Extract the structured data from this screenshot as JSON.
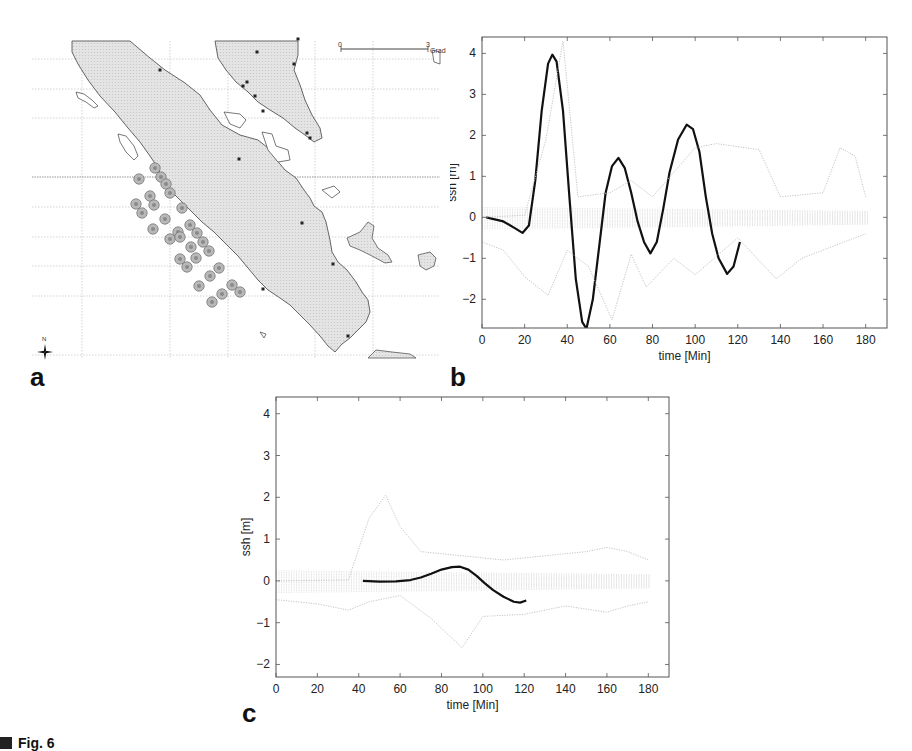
{
  "figure": {
    "caption": "Fig. 6",
    "panel_labels": {
      "a": "a",
      "b": "b",
      "c": "c"
    }
  },
  "map": {
    "scale_bar": {
      "start": "0",
      "end": "3",
      "unit": "Grad"
    },
    "compass": {
      "label": "N"
    },
    "land_color": "#dcdcdc",
    "marker_color": "#8a8a8a",
    "source_points": [
      [
        155,
        168
      ],
      [
        161,
        177
      ],
      [
        166,
        184
      ],
      [
        170,
        193
      ],
      [
        139,
        179
      ],
      [
        150,
        196
      ],
      [
        154,
        205
      ],
      [
        136,
        204
      ],
      [
        142,
        213
      ],
      [
        182,
        208
      ],
      [
        165,
        219
      ],
      [
        153,
        229
      ],
      [
        178,
        232
      ],
      [
        170,
        239
      ],
      [
        190,
        225
      ],
      [
        197,
        233
      ],
      [
        203,
        242
      ],
      [
        209,
        251
      ],
      [
        180,
        237
      ],
      [
        191,
        247
      ],
      [
        196,
        258
      ],
      [
        180,
        259
      ],
      [
        187,
        267
      ],
      [
        219,
        268
      ],
      [
        210,
        276
      ],
      [
        232,
        285
      ],
      [
        240,
        292
      ],
      [
        199,
        286
      ],
      [
        222,
        294
      ],
      [
        212,
        302
      ]
    ],
    "city_points": [
      [
        160,
        70
      ],
      [
        257,
        52
      ],
      [
        298,
        39
      ],
      [
        294,
        64
      ],
      [
        247,
        82
      ],
      [
        243,
        86
      ],
      [
        255,
        96
      ],
      [
        263,
        111
      ],
      [
        307,
        133
      ],
      [
        310,
        138
      ],
      [
        239,
        159
      ],
      [
        302,
        223
      ],
      [
        333,
        264
      ],
      [
        263,
        289
      ],
      [
        348,
        336
      ]
    ]
  },
  "chart_data": [
    {
      "panel": "b",
      "type": "line",
      "title": "",
      "xlabel": "time [Min]",
      "ylabel": "ssh [m]",
      "xlim": [
        0,
        190
      ],
      "ylim": [
        -2.7,
        4.4
      ],
      "xticks": [
        0,
        20,
        40,
        60,
        80,
        100,
        120,
        140,
        160,
        180
      ],
      "yticks": [
        -2,
        -1,
        0,
        1,
        2,
        3,
        4
      ],
      "grid": false,
      "legend": null,
      "series": [
        {
          "name": "highlighted gauge",
          "style": "thick black",
          "x": [
            2,
            10,
            15,
            19,
            22,
            25,
            28,
            31,
            33,
            35,
            38,
            41,
            44,
            47,
            49,
            52,
            55,
            58,
            61,
            64,
            67,
            70,
            73,
            76,
            79,
            82,
            85,
            88,
            92,
            96,
            99,
            102,
            105,
            108,
            111,
            115,
            118,
            121
          ],
          "y": [
            0,
            -0.1,
            -0.25,
            -0.38,
            -0.2,
            0.9,
            2.6,
            3.75,
            3.97,
            3.8,
            2.6,
            0.5,
            -1.5,
            -2.55,
            -2.72,
            -2.0,
            -0.7,
            0.6,
            1.25,
            1.45,
            1.2,
            0.6,
            -0.1,
            -0.6,
            -0.88,
            -0.6,
            0.2,
            1.1,
            1.9,
            2.26,
            2.15,
            1.6,
            0.5,
            -0.4,
            -1.0,
            -1.38,
            -1.2,
            -0.6
          ]
        },
        {
          "name": "other gauges (envelope upper)",
          "style": "thin grey dotted",
          "x": [
            0,
            20,
            30,
            38,
            45,
            60,
            70,
            80,
            100,
            110,
            130,
            140,
            160,
            168,
            175,
            180
          ],
          "y": [
            0.0,
            0.05,
            1.9,
            4.3,
            0.5,
            0.6,
            0.9,
            0.5,
            1.7,
            1.8,
            1.65,
            0.5,
            0.6,
            1.7,
            1.5,
            0.5
          ]
        },
        {
          "name": "other gauges (envelope lower)",
          "style": "thin grey dotted",
          "x": [
            0,
            10,
            20,
            31,
            40,
            50,
            61,
            70,
            77,
            90,
            100,
            120,
            138,
            150,
            165,
            180
          ],
          "y": [
            -0.6,
            -0.8,
            -1.45,
            -1.9,
            -0.8,
            -1.2,
            -2.5,
            -0.9,
            -1.7,
            -1.0,
            -1.4,
            -0.5,
            -1.5,
            -1.0,
            -0.7,
            -0.4
          ]
        }
      ]
    },
    {
      "panel": "c",
      "type": "line",
      "title": "",
      "xlabel": "time [Min]",
      "ylabel": "ssh [m]",
      "xlim": [
        0,
        190
      ],
      "ylim": [
        -2.3,
        4.4
      ],
      "xticks": [
        0,
        20,
        40,
        60,
        80,
        100,
        120,
        140,
        160,
        180
      ],
      "yticks": [
        -2,
        -1,
        0,
        1,
        2,
        3,
        4
      ],
      "grid": false,
      "legend": null,
      "series": [
        {
          "name": "highlighted gauge",
          "style": "thick black",
          "x": [
            42,
            50,
            58,
            65,
            70,
            75,
            80,
            85,
            89,
            93,
            97,
            101,
            105,
            110,
            115,
            118,
            121
          ],
          "y": [
            0,
            -0.02,
            -0.01,
            0.02,
            0.08,
            0.17,
            0.27,
            0.33,
            0.34,
            0.27,
            0.12,
            -0.06,
            -0.22,
            -0.38,
            -0.5,
            -0.52,
            -0.47
          ]
        },
        {
          "name": "other gauges (envelope upper)",
          "style": "thin grey dotted",
          "x": [
            0,
            35,
            45,
            53,
            60,
            70,
            90,
            110,
            130,
            150,
            160,
            170,
            180
          ],
          "y": [
            0,
            0.02,
            1.5,
            2.05,
            1.3,
            0.7,
            0.6,
            0.5,
            0.6,
            0.7,
            0.8,
            0.7,
            0.5
          ]
        },
        {
          "name": "other gauges (envelope lower)",
          "style": "thin grey dotted",
          "x": [
            0,
            20,
            35,
            45,
            60,
            75,
            90,
            100,
            120,
            140,
            160,
            170,
            180
          ],
          "y": [
            -0.45,
            -0.55,
            -0.7,
            -0.5,
            -0.35,
            -0.9,
            -1.6,
            -0.85,
            -0.8,
            -0.6,
            -0.75,
            -0.6,
            -0.5
          ]
        }
      ]
    }
  ]
}
